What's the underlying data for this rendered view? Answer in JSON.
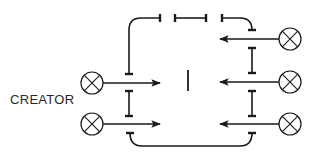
{
  "label": {
    "creator": "CREATOR"
  },
  "colors": {
    "stroke": "#1a1a1a",
    "background": "#ffffff"
  },
  "lamps": [
    {
      "id": "left-1",
      "cx": 92,
      "cy": 83,
      "r": 11
    },
    {
      "id": "left-2",
      "cx": 92,
      "cy": 124,
      "r": 11
    },
    {
      "id": "right-1",
      "cx": 290,
      "cy": 39,
      "r": 11
    },
    {
      "id": "right-2",
      "cx": 290,
      "cy": 82,
      "r": 11
    },
    {
      "id": "right-3",
      "cx": 290,
      "cy": 124,
      "r": 11
    }
  ],
  "arrows": [
    {
      "id": "left-arrow-1",
      "x1": 103,
      "y": 83,
      "x2": 160
    },
    {
      "id": "left-arrow-2",
      "x1": 103,
      "y": 124,
      "x2": 160
    },
    {
      "id": "right-arrow-1",
      "x1": 279,
      "y": 39,
      "x2": 220
    },
    {
      "id": "right-arrow-2",
      "x1": 279,
      "y": 82,
      "x2": 220
    },
    {
      "id": "right-arrow-3",
      "x1": 279,
      "y": 124,
      "x2": 220
    }
  ],
  "ibeams": [
    {
      "id": "left-ibeam",
      "x": 129,
      "y1": 91,
      "y2": 116
    },
    {
      "id": "right-ibeam-1",
      "x": 252,
      "y1": 48,
      "y2": 73
    },
    {
      "id": "right-ibeam-2",
      "x": 252,
      "y1": 91,
      "y2": 116
    },
    {
      "id": "top-segment",
      "x1": 175,
      "x2": 206,
      "y": 18,
      "horizontal": true
    }
  ],
  "center_bar": {
    "x": 188,
    "y1": 70,
    "y2": 91
  },
  "paths": [
    {
      "id": "top-left-path",
      "d": "M129 74 L129 30 Q129 18 141 18 L160 18",
      "tick": {
        "x1": 160,
        "y1": 14,
        "x2": 160,
        "y2": 22
      },
      "tick2": {
        "x1": 125,
        "y1": 74,
        "x2": 133,
        "y2": 74
      }
    },
    {
      "id": "top-right-path",
      "d": "M222 18 L240 18 Q252 18 252 30",
      "tick": {
        "x1": 222,
        "y1": 14,
        "x2": 222,
        "y2": 22
      },
      "tick2": {
        "x1": 248,
        "y1": 30,
        "x2": 256,
        "y2": 30
      }
    },
    {
      "id": "bottom-path",
      "d": "M130 133 Q130 146 142 146 L240 146 Q252 146 252 133",
      "tick": {
        "x1": 126,
        "y1": 133,
        "x2": 134,
        "y2": 133
      },
      "tick2": {
        "x1": 248,
        "y1": 133,
        "x2": 256,
        "y2": 133
      }
    }
  ]
}
